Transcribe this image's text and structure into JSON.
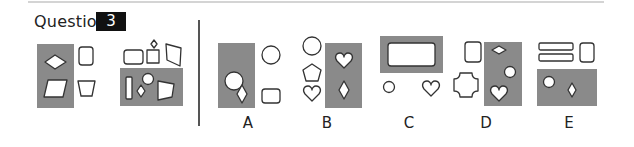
{
  "question": {
    "label": "Question",
    "number": "3"
  },
  "colors": {
    "panel_gray": "#8a8a8a",
    "stroke": "#333333",
    "badge_bg": "#111111",
    "badge_text": "#ffffff"
  },
  "stem": [
    {
      "name": "figure-1",
      "shaded_panel": [
        "diamond",
        "parallelogram"
      ],
      "outside": [
        "rounded-rectangle",
        "trapezoid"
      ]
    },
    {
      "name": "figure-2",
      "outside": [
        "rounded-rectangle",
        "small-square",
        "small-diamond",
        "quadrilateral"
      ],
      "shaded_panel": [
        "tall-rectangle",
        "circle",
        "diamond",
        "trapezoid"
      ]
    }
  ],
  "options": [
    {
      "label": "A",
      "shaded_panel": [
        "circle",
        "diamond"
      ],
      "outside": [
        "circle",
        "rounded-rectangle"
      ]
    },
    {
      "label": "B",
      "outside": [
        "circle",
        "pentagon",
        "heart"
      ],
      "shaded_panel": [
        "heart",
        "diamond"
      ]
    },
    {
      "label": "C",
      "shaded_panel": [
        "rounded-rectangle"
      ],
      "outside": [
        "small-circle",
        "heart"
      ]
    },
    {
      "label": "D",
      "outside": [
        "rounded-rectangle",
        "four-point-star"
      ],
      "shaded_panel": [
        "diamond",
        "circle",
        "heart"
      ]
    },
    {
      "label": "E",
      "outside": [
        "bar",
        "bar",
        "rounded-rectangle"
      ],
      "shaded_panel": [
        "circle",
        "diamond"
      ]
    }
  ]
}
